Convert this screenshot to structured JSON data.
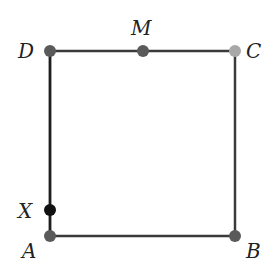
{
  "diagram": {
    "type": "square-geometry",
    "colors": {
      "edge": "#3a3a3a",
      "edge_left": "#1e1e1e",
      "point_default": "#5a5a5a",
      "point_C": "#a8a8a8",
      "point_X": "#111111",
      "label": "#222222"
    },
    "points": [
      {
        "id": "D",
        "label": "D",
        "x": 50,
        "y": 51
      },
      {
        "id": "M",
        "label": "M",
        "x": 143,
        "y": 51
      },
      {
        "id": "C",
        "label": "C",
        "x": 235,
        "y": 51
      },
      {
        "id": "A",
        "label": "A",
        "x": 50,
        "y": 236
      },
      {
        "id": "B",
        "label": "B",
        "x": 235,
        "y": 236
      },
      {
        "id": "X",
        "label": "X",
        "x": 50,
        "y": 210
      }
    ],
    "edges": [
      {
        "from": "D",
        "to": "C"
      },
      {
        "from": "C",
        "to": "B"
      },
      {
        "from": "B",
        "to": "A"
      },
      {
        "from": "A",
        "to": "D"
      }
    ]
  }
}
